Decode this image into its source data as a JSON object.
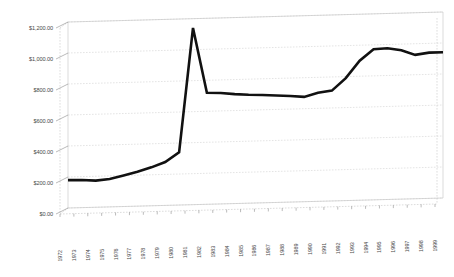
{
  "chart_data": {
    "type": "line",
    "title": "",
    "subtitle": "",
    "xlabel": "",
    "ylabel": "",
    "grid": true,
    "legend": false,
    "legend_position": "none",
    "style": "3d-perspective-line",
    "ylim": [
      0,
      1200
    ],
    "ytick_step": 200,
    "ytick_labels": [
      "$0.00",
      "$200.00",
      "$400.00",
      "$600.00",
      "$800.00",
      "$1,000.00",
      "$1,200.00"
    ],
    "ytick_values": [
      0,
      200,
      400,
      600,
      800,
      1000,
      1200
    ],
    "categories": [
      "1972",
      "1973",
      "1974",
      "1975",
      "1976",
      "1977",
      "1978",
      "1979",
      "1980",
      "1981",
      "1982",
      "1983",
      "1984",
      "1985",
      "1986",
      "1987",
      "1988",
      "1989",
      "1990",
      "1991",
      "1992",
      "1993",
      "1994",
      "1995",
      "1996",
      "1997",
      "1998",
      "1999"
    ],
    "values": [
      180,
      178,
      172,
      180,
      200,
      222,
      248,
      280,
      340,
      1140,
      720,
      716,
      706,
      700,
      696,
      690,
      684,
      676,
      700,
      712,
      790,
      900,
      972,
      976,
      960,
      928,
      940,
      940
    ],
    "series": [
      {
        "name": "Series 1",
        "color": "#111111",
        "values": [
          180,
          178,
          172,
          180,
          200,
          222,
          248,
          280,
          340,
          1140,
          720,
          716,
          706,
          700,
          696,
          690,
          684,
          676,
          700,
          712,
          790,
          900,
          972,
          976,
          960,
          928,
          940,
          940
        ]
      }
    ],
    "annotations": [],
    "colors": {
      "line": "#111111",
      "grid": "#c9c9c9",
      "wall": "#b5b5b5",
      "text": "#4a4a4a",
      "background": "#ffffff"
    }
  }
}
